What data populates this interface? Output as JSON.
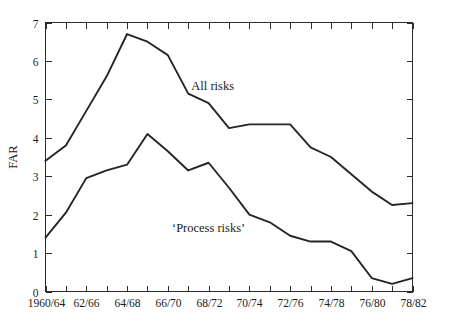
{
  "chart_data": {
    "type": "line",
    "title": "",
    "xlabel": "",
    "ylabel": "FAR",
    "ylim": [
      0,
      7
    ],
    "yticks": [
      0,
      1,
      2,
      3,
      4,
      5,
      6,
      7
    ],
    "ytick_labels": [
      "0",
      "1",
      "2",
      "3",
      "4",
      "5",
      "6",
      "7"
    ],
    "grid": false,
    "legend_position": "inline-annotation",
    "frame": "box-with-ticks-all-sides",
    "x_minor_ticks": true,
    "x": [
      "1960/64",
      "61/65",
      "62/66",
      "63/67",
      "64/68",
      "65/69",
      "66/70",
      "67/71",
      "68/72",
      "69/73",
      "70/74",
      "71/75",
      "72/76",
      "73/77",
      "74/78",
      "75/79",
      "76/80",
      "77/81",
      "78/82"
    ],
    "xtick_labels": [
      "1960/64",
      "62/66",
      "64/68",
      "66/70",
      "68/72",
      "70/74",
      "72/76",
      "74/78",
      "76/80",
      "78/82"
    ],
    "xtick_label_every": 2,
    "series": [
      {
        "name": "All risks",
        "label": "All risks",
        "color": "#252525",
        "values": [
          3.4,
          3.8,
          4.7,
          5.6,
          6.7,
          6.5,
          6.15,
          5.15,
          4.9,
          4.25,
          4.35,
          4.35,
          4.35,
          3.75,
          3.5,
          3.05,
          2.6,
          2.25,
          2.3
        ]
      },
      {
        "name": "Process risks",
        "label": "‘Process risks’",
        "color": "#252525",
        "values": [
          1.4,
          2.05,
          2.95,
          3.15,
          3.3,
          4.1,
          3.65,
          3.15,
          3.35,
          2.7,
          2.0,
          1.8,
          1.45,
          1.3,
          1.3,
          1.05,
          0.35,
          0.2,
          0.35
        ]
      }
    ],
    "annotations": [
      {
        "text": "All risks",
        "x_index": 8.2,
        "y_value": 5.25
      },
      {
        "text": "‘Process risks’",
        "x_index": 8.0,
        "y_value": 1.55
      }
    ]
  }
}
